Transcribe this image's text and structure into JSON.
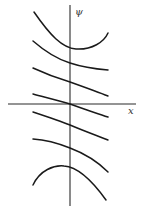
{
  "figure": {
    "axis_labels": {
      "y": "ψ",
      "x": "x"
    },
    "colors": {
      "line": "#1a1a1a",
      "axis": "#2a2a2a",
      "background": "#ffffff"
    },
    "axes": {
      "x_axis": {
        "x1": 8,
        "x2": 136,
        "y": 104
      },
      "y_axis": {
        "x": 70,
        "y1": 5,
        "y2": 206
      }
    },
    "curves": [
      {
        "name": "curve-1",
        "d": "M34,12 C50,35 62,48 76,49 C92,50 104,42 108,33"
      },
      {
        "name": "curve-2",
        "d": "M33,41 C48,54 60,60 70,63 C82,67 96,69 108,70"
      },
      {
        "name": "curve-3",
        "d": "M33,68 C48,75 60,79 70,82 C84,87 98,92 108,96"
      },
      {
        "name": "curve-4",
        "d": "M33,94 C48,98 60,101 70,104 C84,109 98,114 108,117"
      },
      {
        "name": "curve-5",
        "d": "M33,112 C48,117 60,121 70,125 C84,131 98,136 108,140"
      },
      {
        "name": "curve-6",
        "d": "M33,139 C48,140 60,144 70,148 C86,154 100,164 108,172"
      },
      {
        "name": "curve-7",
        "d": "M33,185 C40,170 54,165 64,166 C80,167 96,186 106,200"
      }
    ]
  }
}
